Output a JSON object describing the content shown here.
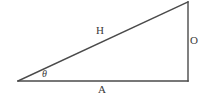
{
  "figure": {
    "type": "right-triangle-trigonometry-diagram",
    "background_color": "#ffffff",
    "stroke_color": "#4a4a4a",
    "text_color": "#3a3a3a",
    "labels": {
      "hypotenuse": "H",
      "opposite": "O",
      "adjacent": "A",
      "angle": "θ"
    },
    "geometry": {
      "vertex_left": [
        18,
        81
      ],
      "vertex_bottom_right": [
        188,
        81
      ],
      "vertex_top_right": [
        188,
        2
      ],
      "base_path": "M 18 81 L 188 81",
      "vertical_path": "M 188 81 L 188 2",
      "hypotenuse_path": "M 18 81 L 188 2"
    }
  }
}
